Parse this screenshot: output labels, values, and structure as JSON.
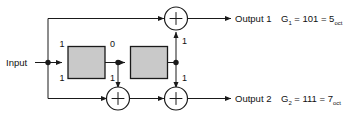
{
  "diagram": {
    "input_label": "Input",
    "outputs": [
      {
        "name": "Output 1",
        "generator": "G",
        "generator_sub": "1",
        "equation": "= 101 = 5",
        "equation_sub": "oct"
      },
      {
        "name": "Output 2",
        "generator": "G",
        "generator_sub": "2",
        "equation": "= 111 = 7",
        "equation_sub": "oct"
      }
    ],
    "tap_labels": {
      "stage0_top": "1",
      "stage0_bottom": "1",
      "stage1_top": "0",
      "stage1_bottom": "1",
      "stage2_top": "1",
      "stage2_bottom": "1"
    },
    "adder_symbol": "+",
    "colors": {
      "register_fill": "#c9c9c9",
      "wire": "#1a1a1a",
      "background": "#ffffff",
      "text": "#111111"
    }
  }
}
